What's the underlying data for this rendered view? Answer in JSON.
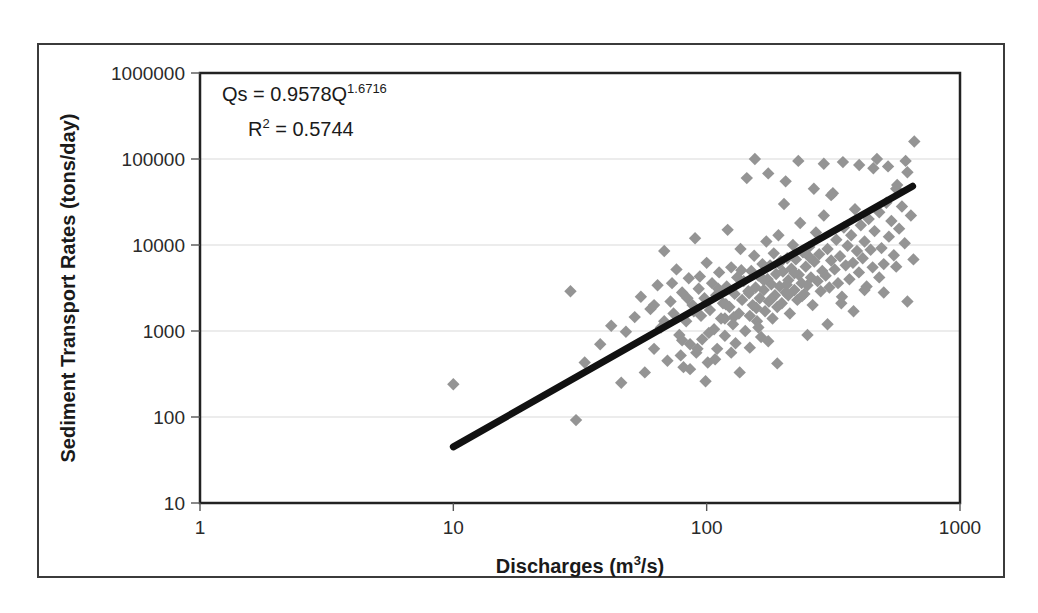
{
  "chart_data": {
    "type": "scatter",
    "title": "",
    "xlabel": "Discharges (m3/s)",
    "xlabel_base": "Discharges (m",
    "xlabel_sup": "3",
    "xlabel_tail": "/s)",
    "ylabel": "Sediment Transport Rates (tons/day)",
    "xscale": "log",
    "yscale": "log",
    "xlim": [
      1,
      1000
    ],
    "ylim": [
      10,
      1000000
    ],
    "xticks": [
      "1",
      "10",
      "100",
      "1000"
    ],
    "xtick_values": [
      1,
      10,
      100,
      1000
    ],
    "yticks": [
      "10",
      "100",
      "1000",
      "10000",
      "100000",
      "1000000"
    ],
    "ytick_values": [
      10,
      100,
      1000,
      10000,
      100000,
      1000000
    ],
    "grid": "horizontal",
    "legend": "none",
    "point_color": "#949494",
    "point_marker": "diamond",
    "trendline_color": "#111111",
    "annotations": [
      {
        "name": "power-law-equation",
        "base": "Qs = 0.9578Q",
        "sup": "1.6716"
      },
      {
        "name": "r-squared",
        "base": "R",
        "sup": "2",
        "tail": " = 0.5744"
      }
    ],
    "fit": {
      "form": "power",
      "coefficient": 0.9578,
      "exponent": 1.6716,
      "r_squared": 0.5744,
      "x_start": 10,
      "x_end": 650,
      "y_start": 46,
      "y_end": 54000
    },
    "points": [
      [
        10.0,
        240
      ],
      [
        29.0,
        2900
      ],
      [
        30.5,
        92
      ],
      [
        33.0,
        430
      ],
      [
        38.0,
        700
      ],
      [
        42.0,
        1150
      ],
      [
        46.0,
        250
      ],
      [
        48.0,
        980
      ],
      [
        52.0,
        1450
      ],
      [
        55.0,
        2500
      ],
      [
        57.0,
        330
      ],
      [
        60.0,
        1800
      ],
      [
        62.0,
        620
      ],
      [
        64.0,
        3400
      ],
      [
        66.0,
        1100
      ],
      [
        68.0,
        8500
      ],
      [
        70.0,
        450
      ],
      [
        72.0,
        2200
      ],
      [
        74.0,
        1600
      ],
      [
        76.0,
        5200
      ],
      [
        78.0,
        900
      ],
      [
        80.0,
        2800
      ],
      [
        81.0,
        380
      ],
      [
        83.0,
        1300
      ],
      [
        85.0,
        4100
      ],
      [
        86.0,
        700
      ],
      [
        88.0,
        2000
      ],
      [
        90.0,
        12000
      ],
      [
        91.0,
        560
      ],
      [
        93.0,
        3100
      ],
      [
        95.0,
        1500
      ],
      [
        96.0,
        800
      ],
      [
        98.0,
        2400
      ],
      [
        100.0,
        6200
      ],
      [
        101.0,
        430
      ],
      [
        103.0,
        1750
      ],
      [
        105.0,
        3600
      ],
      [
        107.0,
        1050
      ],
      [
        109.0,
        2600
      ],
      [
        110.0,
        620
      ],
      [
        112.0,
        4800
      ],
      [
        114.0,
        1400
      ],
      [
        116.0,
        2100
      ],
      [
        118.0,
        880
      ],
      [
        120.0,
        3300
      ],
      [
        121.0,
        15000
      ],
      [
        123.0,
        1900
      ],
      [
        125.0,
        5500
      ],
      [
        127.0,
        1200
      ],
      [
        129.0,
        2700
      ],
      [
        130.0,
        720
      ],
      [
        132.0,
        4200
      ],
      [
        134.0,
        1600
      ],
      [
        136.0,
        9000
      ],
      [
        138.0,
        2300
      ],
      [
        140.0,
        3800
      ],
      [
        142.0,
        1000
      ],
      [
        144.0,
        60000
      ],
      [
        146.0,
        2900
      ],
      [
        148.0,
        1500
      ],
      [
        150.0,
        5000
      ],
      [
        152.0,
        2000
      ],
      [
        154.0,
        7500
      ],
      [
        156.0,
        3200
      ],
      [
        158.0,
        1300
      ],
      [
        160.0,
        4400
      ],
      [
        162.0,
        2400
      ],
      [
        164.0,
        850
      ],
      [
        166.0,
        6000
      ],
      [
        168.0,
        3000
      ],
      [
        170.0,
        1700
      ],
      [
        172.0,
        11000
      ],
      [
        174.0,
        4000
      ],
      [
        176.0,
        2200
      ],
      [
        178.0,
        5800
      ],
      [
        180.0,
        3500
      ],
      [
        182.0,
        1400
      ],
      [
        184.0,
        8000
      ],
      [
        186.0,
        2600
      ],
      [
        188.0,
        4600
      ],
      [
        190.0,
        1900
      ],
      [
        192.0,
        13000
      ],
      [
        194.0,
        3300
      ],
      [
        196.0,
        6500
      ],
      [
        198.0,
        2100
      ],
      [
        200.0,
        4900
      ],
      [
        202.0,
        30000
      ],
      [
        205.0,
        2800
      ],
      [
        208.0,
        7000
      ],
      [
        210.0,
        3900
      ],
      [
        213.0,
        1600
      ],
      [
        216.0,
        5300
      ],
      [
        219.0,
        10000
      ],
      [
        222.0,
        3000
      ],
      [
        225.0,
        6800
      ],
      [
        228.0,
        2300
      ],
      [
        231.0,
        4500
      ],
      [
        234.0,
        18000
      ],
      [
        237.0,
        3600
      ],
      [
        240.0,
        8200
      ],
      [
        243.0,
        2700
      ],
      [
        246.0,
        5600
      ],
      [
        250.0,
        3400
      ],
      [
        254.0,
        9500
      ],
      [
        258.0,
        4200
      ],
      [
        262.0,
        2000
      ],
      [
        266.0,
        6400
      ],
      [
        270.0,
        14000
      ],
      [
        274.0,
        3800
      ],
      [
        278.0,
        7800
      ],
      [
        282.0,
        2900
      ],
      [
        286.0,
        5000
      ],
      [
        290.0,
        22000
      ],
      [
        295.0,
        4400
      ],
      [
        300.0,
        9000
      ],
      [
        305.0,
        3200
      ],
      [
        310.0,
        6600
      ],
      [
        315.0,
        40000
      ],
      [
        320.0,
        5200
      ],
      [
        325.0,
        11500
      ],
      [
        330.0,
        3600
      ],
      [
        336.0,
        7400
      ],
      [
        342.0,
        2500
      ],
      [
        348.0,
        16000
      ],
      [
        354.0,
        5800
      ],
      [
        360.0,
        9800
      ],
      [
        366.0,
        4000
      ],
      [
        372.0,
        13000
      ],
      [
        378.0,
        6200
      ],
      [
        385.0,
        26000
      ],
      [
        392.0,
        8500
      ],
      [
        399.0,
        4800
      ],
      [
        406.0,
        17000
      ],
      [
        413.0,
        7000
      ],
      [
        420.0,
        11000
      ],
      [
        428.0,
        3300
      ],
      [
        436.0,
        20000
      ],
      [
        444.0,
        8800
      ],
      [
        452.0,
        5500
      ],
      [
        460.0,
        14500
      ],
      [
        470.0,
        100000
      ],
      [
        480.0,
        24000
      ],
      [
        490.0,
        9200
      ],
      [
        500.0,
        6000
      ],
      [
        512.0,
        31000
      ],
      [
        524.0,
        12500
      ],
      [
        536.0,
        19000
      ],
      [
        548.0,
        7600
      ],
      [
        560.0,
        45000
      ],
      [
        575.0,
        15500
      ],
      [
        590.0,
        28000
      ],
      [
        605.0,
        10500
      ],
      [
        620.0,
        70000
      ],
      [
        640.0,
        22000
      ],
      [
        655.0,
        6800
      ],
      [
        500.0,
        2800
      ],
      [
        300.0,
        1200
      ],
      [
        250.0,
        900
      ],
      [
        210.0,
        2600
      ],
      [
        190.0,
        420
      ],
      [
        175.0,
        760
      ],
      [
        160.0,
        1100
      ],
      [
        148.0,
        640
      ],
      [
        135.0,
        330
      ],
      [
        125.0,
        560
      ],
      [
        118.0,
        1400
      ],
      [
        108.0,
        470
      ],
      [
        99.0,
        260
      ],
      [
        92.0,
        620
      ],
      [
        86.0,
        360
      ],
      [
        80.0,
        780
      ],
      [
        340.0,
        2100
      ],
      [
        420.0,
        3000
      ],
      [
        380.0,
        1700
      ],
      [
        480.0,
        4200
      ],
      [
        560.0,
        5600
      ],
      [
        620.0,
        2200
      ],
      [
        155.0,
        100000
      ],
      [
        230.0,
        95000
      ],
      [
        290.0,
        88000
      ],
      [
        345.0,
        92000
      ],
      [
        400.0,
        85000
      ],
      [
        455.0,
        78000
      ],
      [
        520.0,
        82000
      ],
      [
        660.0,
        160000
      ],
      [
        610.0,
        95000
      ],
      [
        565.0,
        50000
      ],
      [
        175.0,
        68000
      ],
      [
        205.0,
        55000
      ],
      [
        265.0,
        45000
      ],
      [
        310.0,
        38000
      ],
      [
        62.0,
        2000
      ],
      [
        68.0,
        1300
      ],
      [
        73.0,
        3600
      ],
      [
        79.0,
        520
      ],
      [
        84.0,
        2400
      ],
      [
        89.0,
        1700
      ],
      [
        94.0,
        4300
      ],
      [
        102.0,
        950
      ],
      [
        111.0,
        3100
      ],
      [
        119.0,
        2050
      ],
      [
        128.0,
        1450
      ],
      [
        137.0,
        5100
      ],
      [
        147.0,
        2750
      ],
      [
        157.0,
        1850
      ],
      [
        168.0,
        3900
      ],
      [
        180.0,
        2350
      ],
      [
        193.0,
        6100
      ],
      [
        207.0,
        3450
      ],
      [
        222.0,
        4700
      ],
      [
        238.0,
        2550
      ],
      [
        255.0,
        7200
      ]
    ]
  },
  "figure": {
    "border_color": "#3b3b3b",
    "background": "#ffffff"
  }
}
